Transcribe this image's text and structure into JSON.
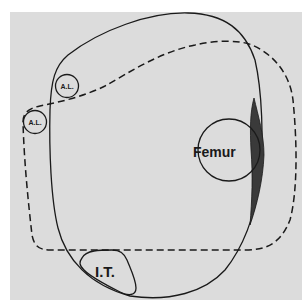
{
  "diagram": {
    "labels": {
      "femur": "Femur",
      "al_upper": "A.L.",
      "al_lower": "A.L.",
      "it": "I.T."
    },
    "colors": {
      "background": "#ffffff",
      "panel": "#dcdcdc",
      "stroke": "#1a1a1a",
      "shaded_region": "#3a3a3a"
    }
  }
}
